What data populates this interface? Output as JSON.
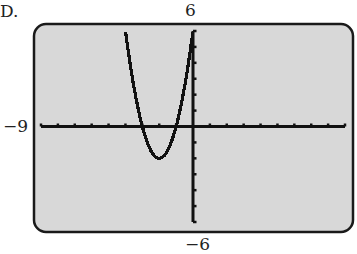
{
  "choice_label": "D.",
  "window": {
    "xmin": "-9",
    "xmax": "9",
    "ymin": "-6",
    "ymax": "6",
    "xmin_label": "−9",
    "ymax_label": "6",
    "ymin_label": "−6"
  },
  "colors": {
    "screen": "#d8d8d8",
    "frame": "#1a1a1a",
    "ink": "#111111"
  },
  "chart_data": {
    "type": "line",
    "title": "",
    "xlabel": "",
    "ylabel": "",
    "xlim": [
      -9,
      9
    ],
    "ylim": [
      -6,
      6
    ],
    "xscale": 1,
    "yscale": 1,
    "grid": false,
    "legend": null,
    "function": "y = 2x^2 + 8x + 6",
    "series": [
      {
        "name": "parabola",
        "x": [
          -4,
          -3.5,
          -3,
          -2.5,
          -2,
          -1.5,
          -1,
          -0.5,
          0
        ],
        "values": [
          6,
          2.5,
          0,
          -1.5,
          -2,
          -1.5,
          0,
          2.5,
          6
        ]
      }
    ],
    "key_points": {
      "vertex": [
        -2,
        -2
      ],
      "x_intercepts": [
        -3,
        -1
      ],
      "y_intercept": 6
    },
    "annotations": [
      "D.",
      "6",
      "−9",
      "−6"
    ]
  }
}
